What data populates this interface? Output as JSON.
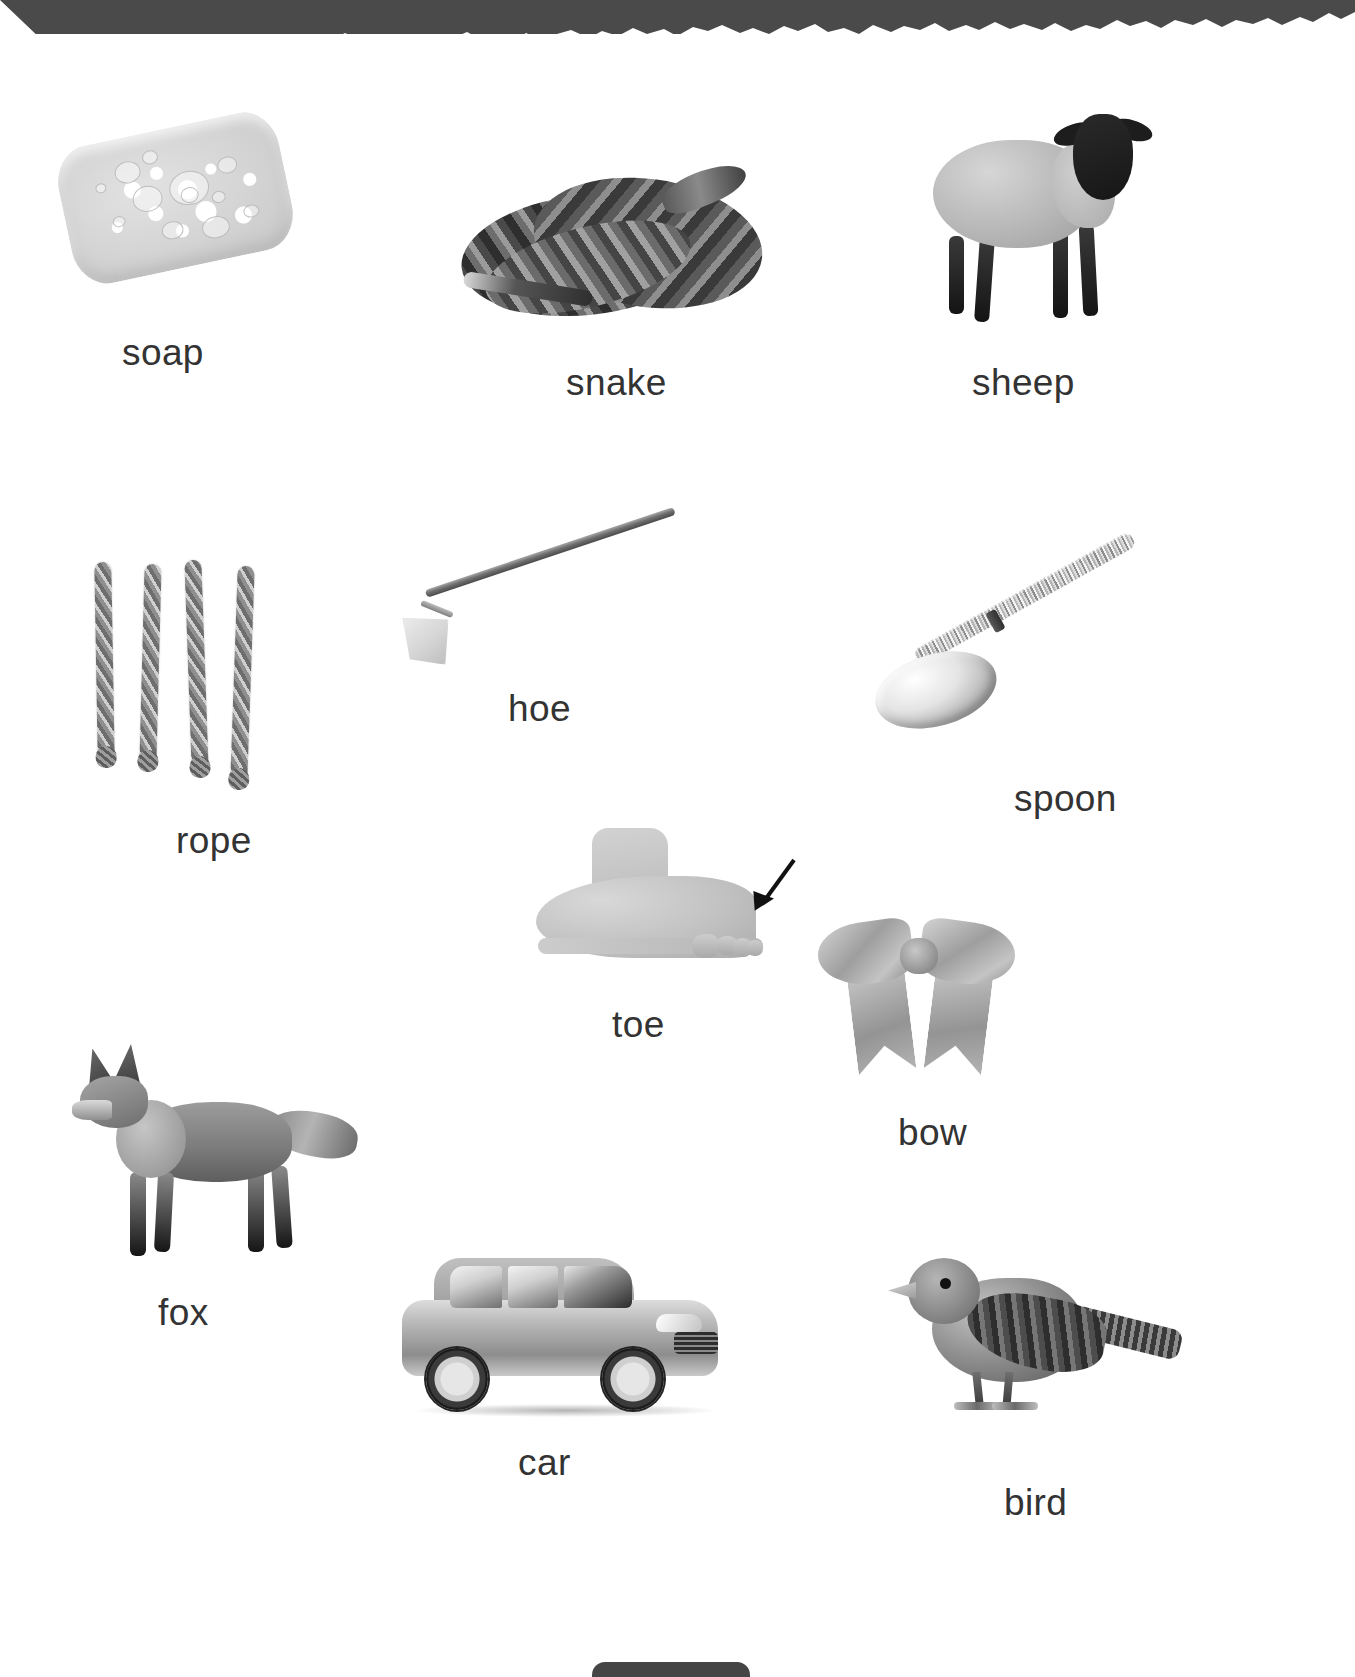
{
  "page": {
    "kind": "picture-vocabulary-worksheet",
    "background_color": "#ffffff",
    "label_color": "#333333",
    "torn_edge_color": "#4a4a4a",
    "bottom_tab_color": "#454545"
  },
  "items": [
    {
      "id": "soap",
      "label": "soap",
      "image": "soap-bar-photo"
    },
    {
      "id": "snake",
      "label": "snake",
      "image": "coiled-snake-photo"
    },
    {
      "id": "sheep",
      "label": "sheep",
      "image": "sheep-photo"
    },
    {
      "id": "rope",
      "label": "rope",
      "image": "rope-strands-photo"
    },
    {
      "id": "hoe",
      "label": "hoe",
      "image": "garden-hoe-photo"
    },
    {
      "id": "spoon",
      "label": "spoon",
      "image": "metal-spoon-photo"
    },
    {
      "id": "toe",
      "label": "toe",
      "image": "foot-with-arrow-photo"
    },
    {
      "id": "bow",
      "label": "bow",
      "image": "ribbon-bow-photo"
    },
    {
      "id": "fox",
      "label": "fox",
      "image": "fox-photo"
    },
    {
      "id": "car",
      "label": "car",
      "image": "hatchback-car-photo"
    },
    {
      "id": "bird",
      "label": "bird",
      "image": "sparrow-bird-photo"
    }
  ]
}
